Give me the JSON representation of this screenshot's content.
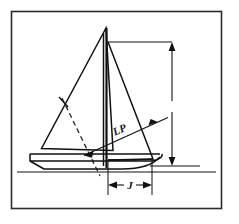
{
  "figure": {
    "type": "line-drawing",
    "background_color": "#ffffff",
    "ink_color": "#111111",
    "frame": {
      "name": "outer-border",
      "x": 11,
      "y": 11,
      "width": 211,
      "height": 198,
      "stroke_color": "#2b2b2b"
    },
    "labels": {
      "lp": "LP",
      "j": "J"
    },
    "annotations": [
      {
        "id": "lp",
        "text": "LP",
        "meaning": "Luff perpendicular of the headsail",
        "x": 118,
        "y": 130,
        "rotation_deg": -22
      },
      {
        "id": "j",
        "text": "J",
        "meaning": "Base of foretriangle, mast to forestay at deck",
        "x": 130,
        "y": 189,
        "rotation_deg": 0
      },
      {
        "id": "i",
        "text": "",
        "meaning": "Height of foretriangle, shown as unlabeled vertical dimension at right",
        "x": 172,
        "y": 110,
        "rotation_deg": 0
      }
    ],
    "dimensions": {
      "vertical_right": {
        "name": "foretriangle-height-dimension",
        "x": 172,
        "y_top": 42,
        "y_bottom": 166,
        "arrow_top": true,
        "arrow_bottom": true,
        "break_gap": [
          100,
          112
        ]
      },
      "horizontal_bottom": {
        "name": "foretriangle-base-dimension",
        "y": 185,
        "x_left": 108,
        "x_right": 152,
        "arrow_left": true,
        "arrow_right": true
      }
    },
    "geometry": {
      "masthead": [
        106,
        28
      ],
      "mast_foot": [
        106,
        166
      ],
      "mainsail": [
        [
          106,
          28
        ],
        [
          42,
          148
        ],
        [
          112,
          150
        ]
      ],
      "jib": [
        [
          108,
          42
        ],
        [
          152,
          160
        ],
        [
          108,
          160
        ]
      ],
      "hull_deck_y": 157,
      "waterline_y": 172
    }
  }
}
